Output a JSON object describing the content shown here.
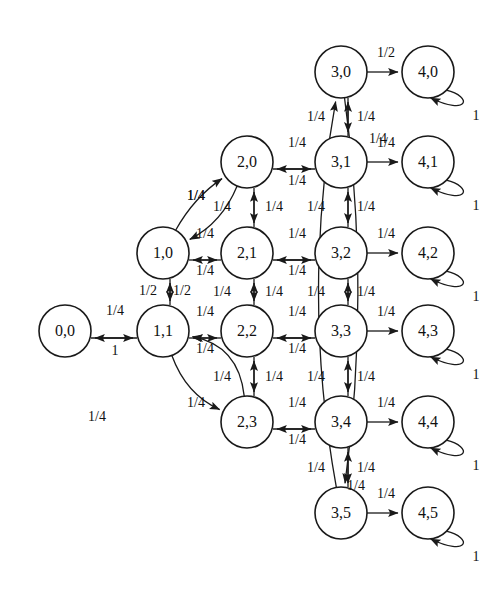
{
  "diagram": {
    "type": "state-transition-graph",
    "width": 494,
    "height": 597,
    "node_radius": 26,
    "stroke_color": "#1a1a1a",
    "fill_color": "#ffffff",
    "nodes": [
      {
        "id": "0,0",
        "label": "0,0",
        "cx": 65,
        "cy": 331
      },
      {
        "id": "1,0",
        "label": "1,0",
        "cx": 163,
        "cy": 253
      },
      {
        "id": "1,1",
        "label": "1,1",
        "cx": 163,
        "cy": 331
      },
      {
        "id": "2,0",
        "label": "2,0",
        "cx": 247,
        "cy": 162
      },
      {
        "id": "2,1",
        "label": "2,1",
        "cx": 247,
        "cy": 253
      },
      {
        "id": "2,2",
        "label": "2,2",
        "cx": 247,
        "cy": 331
      },
      {
        "id": "2,3",
        "label": "2,3",
        "cx": 247,
        "cy": 422
      },
      {
        "id": "3,0",
        "label": "3,0",
        "cx": 341,
        "cy": 72
      },
      {
        "id": "3,1",
        "label": "3,1",
        "cx": 341,
        "cy": 162
      },
      {
        "id": "3,2",
        "label": "3,2",
        "cx": 341,
        "cy": 253
      },
      {
        "id": "3,3",
        "label": "3,3",
        "cx": 341,
        "cy": 331
      },
      {
        "id": "3,4",
        "label": "3,4",
        "cx": 341,
        "cy": 422
      },
      {
        "id": "3,5",
        "label": "3,5",
        "cx": 341,
        "cy": 513
      },
      {
        "id": "4,0",
        "label": "4,0",
        "cx": 428,
        "cy": 72
      },
      {
        "id": "4,1",
        "label": "4,1",
        "cx": 428,
        "cy": 162
      },
      {
        "id": "4,2",
        "label": "4,2",
        "cx": 428,
        "cy": 253
      },
      {
        "id": "4,3",
        "label": "4,3",
        "cx": 428,
        "cy": 331
      },
      {
        "id": "4,4",
        "label": "4,4",
        "cx": 428,
        "cy": 422
      },
      {
        "id": "4,5",
        "label": "4,5",
        "cx": 428,
        "cy": 513
      }
    ],
    "edges": [
      {
        "from": "1,1",
        "to": "0,0",
        "label": "1/4",
        "label_x": 115,
        "label_y": 312
      },
      {
        "from": "0,0",
        "to": "1,1",
        "label": "1",
        "label_x": 115,
        "label_y": 352
      },
      {
        "from": "1,0",
        "to": "1,1",
        "label": "1/2",
        "label_x": 148,
        "label_y": 292
      },
      {
        "from": "1,1",
        "to": "1,0",
        "label": "1/2",
        "label_x": 182,
        "label_y": 292
      },
      {
        "from": "2,1",
        "to": "1,0",
        "label": "1/4",
        "label_x": 205,
        "label_y": 235
      },
      {
        "from": "1,0",
        "to": "2,1",
        "label": "1/4",
        "label_x": 205,
        "label_y": 272
      },
      {
        "from": "2,2",
        "to": "1,1",
        "label": "1/4",
        "label_x": 205,
        "label_y": 313
      },
      {
        "from": "1,1",
        "to": "2,2",
        "label": "1/4",
        "label_x": 205,
        "label_y": 350
      },
      {
        "from": "1,0",
        "to": "2,0",
        "label": "1/4",
        "label_x": 196,
        "label_y": 197
      },
      {
        "from": "2,0",
        "to": "1,0",
        "label": "1/4",
        "label_x": 196,
        "label_y": 197
      },
      {
        "from": "1,1",
        "to": "2,3",
        "label": "1/4",
        "label_x": 196,
        "label_y": 404
      },
      {
        "from": "2,3",
        "to": "1,1",
        "label": "1/4",
        "label_x": 97,
        "label_y": 418
      },
      {
        "from": "2,0",
        "to": "2,1",
        "label": "1/4",
        "label_x": 222,
        "label_y": 208
      },
      {
        "from": "2,1",
        "to": "2,0",
        "label": "1/4",
        "label_x": 274,
        "label_y": 208
      },
      {
        "from": "2,1",
        "to": "2,2",
        "label": "1/4",
        "label_x": 222,
        "label_y": 293
      },
      {
        "from": "2,2",
        "to": "2,1",
        "label": "1/4",
        "label_x": 274,
        "label_y": 293
      },
      {
        "from": "2,2",
        "to": "2,3",
        "label": "1/4",
        "label_x": 222,
        "label_y": 378
      },
      {
        "from": "2,3",
        "to": "2,2",
        "label": "1/4",
        "label_x": 274,
        "label_y": 378
      },
      {
        "from": "3,1",
        "to": "2,0",
        "label": "1/4",
        "label_x": 297,
        "label_y": 144
      },
      {
        "from": "2,0",
        "to": "3,1",
        "label": "1/4",
        "label_x": 297,
        "label_y": 182
      },
      {
        "from": "3,2",
        "to": "2,1",
        "label": "1/4",
        "label_x": 297,
        "label_y": 235
      },
      {
        "from": "2,1",
        "to": "3,2",
        "label": "1/4",
        "label_x": 297,
        "label_y": 272
      },
      {
        "from": "3,3",
        "to": "2,2",
        "label": "1/4",
        "label_x": 297,
        "label_y": 313
      },
      {
        "from": "2,2",
        "to": "3,3",
        "label": "1/4",
        "label_x": 297,
        "label_y": 350
      },
      {
        "from": "3,4",
        "to": "2,3",
        "label": "1/4",
        "label_x": 297,
        "label_y": 404
      },
      {
        "from": "2,3",
        "to": "3,4",
        "label": "1/4",
        "label_x": 297,
        "label_y": 441
      },
      {
        "from": "3,0",
        "to": "3,1",
        "label": "1/4",
        "label_x": 316,
        "label_y": 118
      },
      {
        "from": "3,1",
        "to": "3,0",
        "label": "1/4",
        "label_x": 366,
        "label_y": 118
      },
      {
        "from": "3,1",
        "to": "3,2",
        "label": "1/4",
        "label_x": 316,
        "label_y": 208
      },
      {
        "from": "3,2",
        "to": "3,1",
        "label": "1/4",
        "label_x": 366,
        "label_y": 208
      },
      {
        "from": "3,2",
        "to": "3,3",
        "label": "1/4",
        "label_x": 316,
        "label_y": 293
      },
      {
        "from": "3,3",
        "to": "3,2",
        "label": "1/4",
        "label_x": 366,
        "label_y": 293
      },
      {
        "from": "3,3",
        "to": "3,4",
        "label": "1/4",
        "label_x": 316,
        "label_y": 378
      },
      {
        "from": "3,4",
        "to": "3,3",
        "label": "1/4",
        "label_x": 366,
        "label_y": 378
      },
      {
        "from": "3,4",
        "to": "3,5",
        "label": "1/4",
        "label_x": 316,
        "label_y": 469
      },
      {
        "from": "3,5",
        "to": "3,4",
        "label": "1/4",
        "label_x": 366,
        "label_y": 469
      },
      {
        "from": "3,0",
        "to": "3,5",
        "label": "1/4",
        "label_x": 378,
        "label_y": 140
      },
      {
        "from": "3,5",
        "to": "3,0",
        "label": "1/4",
        "label_x": 356,
        "label_y": 487
      },
      {
        "from": "3,0",
        "to": "4,0",
        "label": "1/2",
        "label_x": 386,
        "label_y": 54
      },
      {
        "from": "3,1",
        "to": "4,1",
        "label": "1/4",
        "label_x": 386,
        "label_y": 144
      },
      {
        "from": "3,2",
        "to": "4,2",
        "label": "1/4",
        "label_x": 386,
        "label_y": 235
      },
      {
        "from": "3,3",
        "to": "4,3",
        "label": "1/4",
        "label_x": 386,
        "label_y": 313
      },
      {
        "from": "3,4",
        "to": "4,4",
        "label": "1/4",
        "label_x": 386,
        "label_y": 404
      },
      {
        "from": "3,5",
        "to": "4,5",
        "label": "1/4",
        "label_x": 386,
        "label_y": 495
      },
      {
        "from": "4,0",
        "to": "4,0",
        "label": "1",
        "label_x": 476,
        "label_y": 117,
        "self_loop": true
      },
      {
        "from": "4,1",
        "to": "4,1",
        "label": "1",
        "label_x": 476,
        "label_y": 207,
        "self_loop": true
      },
      {
        "from": "4,2",
        "to": "4,2",
        "label": "1",
        "label_x": 476,
        "label_y": 298,
        "self_loop": true
      },
      {
        "from": "4,3",
        "to": "4,3",
        "label": "1",
        "label_x": 476,
        "label_y": 376,
        "self_loop": true
      },
      {
        "from": "4,4",
        "to": "4,4",
        "label": "1",
        "label_x": 476,
        "label_y": 467,
        "self_loop": true
      },
      {
        "from": "4,5",
        "to": "4,5",
        "label": "1",
        "label_x": 476,
        "label_y": 558,
        "self_loop": true
      }
    ]
  }
}
